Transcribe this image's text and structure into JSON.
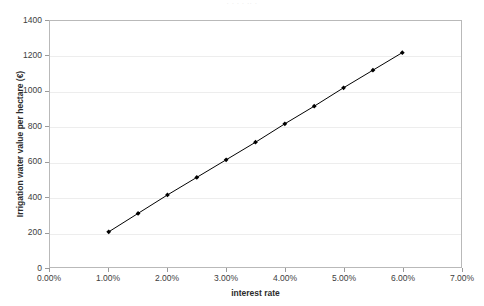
{
  "figure": {
    "caption_remnant": "·  ·      ·            ·        ··    ·"
  },
  "chart_data": {
    "type": "line",
    "title": "",
    "xlabel": "interest rate",
    "ylabel": "Irrigation water value per hectare (€)",
    "xlim": [
      0,
      7
    ],
    "ylim": [
      0,
      1400
    ],
    "grid": true,
    "legend": "none",
    "marker": "diamond",
    "marker_color": "#000000",
    "line_color": "#000000",
    "x_tick_labels": [
      "0.00%",
      "1.00%",
      "2.00%",
      "3.00%",
      "4.00%",
      "5.00%",
      "6.00%",
      "7.00%"
    ],
    "x_ticks": [
      0,
      1,
      2,
      3,
      4,
      5,
      6,
      7
    ],
    "y_tick_labels": [
      "0",
      "200",
      "400",
      "600",
      "800",
      "1000",
      "1200",
      "1400"
    ],
    "y_ticks": [
      0,
      200,
      400,
      600,
      800,
      1000,
      1200,
      1400
    ],
    "x": [
      1.0,
      1.5,
      2.0,
      2.5,
      3.0,
      3.5,
      4.0,
      4.5,
      5.0,
      5.5,
      6.0
    ],
    "values": [
      200,
      305,
      410,
      510,
      610,
      710,
      815,
      915,
      1020,
      1120,
      1220
    ],
    "series": [
      {
        "name": "Irrigation water value",
        "x": [
          1.0,
          1.5,
          2.0,
          2.5,
          3.0,
          3.5,
          4.0,
          4.5,
          5.0,
          5.5,
          6.0
        ],
        "values": [
          200,
          305,
          410,
          510,
          610,
          710,
          815,
          915,
          1020,
          1120,
          1220
        ]
      }
    ]
  }
}
